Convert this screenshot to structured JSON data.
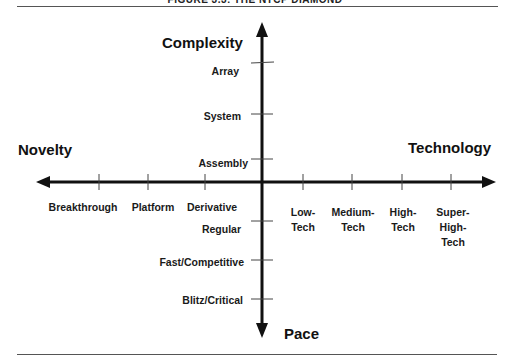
{
  "figure": {
    "title_clipped": "FIGURE 3.3: THE NTCP DIAMOND"
  },
  "axes": {
    "complexity": {
      "title": "Complexity",
      "ticks": [
        "Assembly",
        "System",
        "Array"
      ]
    },
    "novelty": {
      "title": "Novelty",
      "ticks": [
        "Derivative",
        "Platform",
        "Breakthrough"
      ]
    },
    "technology": {
      "title": "Technology",
      "ticks": [
        "Low-\nTech",
        "Medium-\nTech",
        "High-\nTech",
        "Super-\nHigh-\nTech"
      ],
      "tick_lines": [
        [
          "Low-",
          "Tech"
        ],
        [
          "Medium-",
          "Tech"
        ],
        [
          "High-",
          "Tech"
        ],
        [
          "Super-",
          "High-",
          "Tech"
        ]
      ]
    },
    "pace": {
      "title": "Pace",
      "ticks": [
        "Regular",
        "Fast/Competitive",
        "Blitz/Critical"
      ]
    }
  },
  "colors": {
    "axis": "#111111",
    "tick": "#444444",
    "rule": "#555555"
  }
}
